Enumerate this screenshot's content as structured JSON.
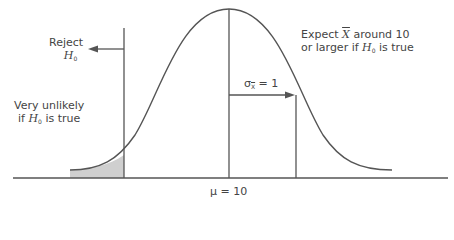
{
  "diagram": {
    "type": "normal-distribution-hypothesis-test",
    "labels": {
      "reject_line1": "Reject",
      "reject_H": "H",
      "reject_sub": "0",
      "unlikely_line1": "Very unlikely",
      "unlikely_if": "if ",
      "unlikely_H": "H",
      "unlikely_sub": "0",
      "unlikely_rest": " is true",
      "expect_pre": "Expect ",
      "expect_X": "X",
      "expect_post": " around 10",
      "expect_line2_pre": "or larger if ",
      "expect_H": "H",
      "expect_sub": "0",
      "expect_line2_post": " is true",
      "sigma_sym": "σ",
      "sigma_sub": "X",
      "sigma_eq": " = 1",
      "mu": "μ = 10"
    },
    "colors": {
      "line": "#555555",
      "shade": "#cfcfcf",
      "text": "#444444"
    }
  }
}
